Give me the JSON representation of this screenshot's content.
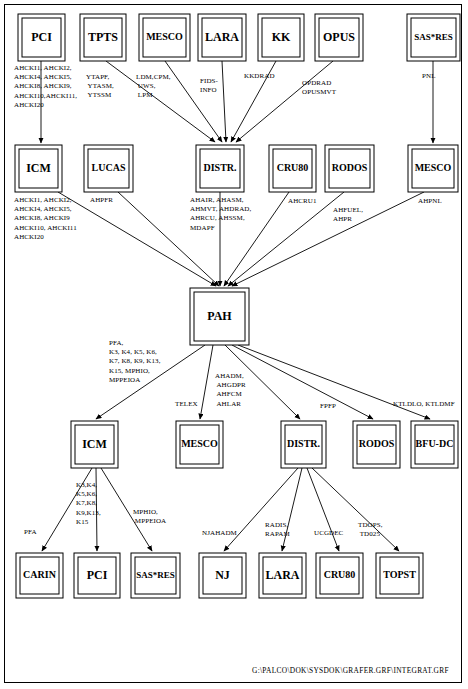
{
  "document": {
    "title": "PAH System Integration Diagram",
    "footer_path": "G:\\PALCO\\DOK\\SYSDOK\\GRAFER.GRF\\INTEGRAT.GRF"
  },
  "nodes": {
    "row1": [
      {
        "id": "pci-top",
        "label": "PCI",
        "x": 18,
        "y": 14,
        "w": 47,
        "h": 47
      },
      {
        "id": "tpts",
        "label": "TPTS",
        "x": 80,
        "y": 14,
        "w": 46,
        "h": 47
      },
      {
        "id": "mesco-top",
        "label": "MESCO",
        "x": 139,
        "y": 14,
        "w": 51,
        "h": 47
      },
      {
        "id": "lara-top",
        "label": "LARA",
        "x": 198,
        "y": 14,
        "w": 48,
        "h": 47
      },
      {
        "id": "kk",
        "label": "KK",
        "x": 258,
        "y": 14,
        "w": 46,
        "h": 47
      },
      {
        "id": "opus",
        "label": "OPUS",
        "x": 315,
        "y": 14,
        "w": 48,
        "h": 47
      },
      {
        "id": "sasres-top",
        "label": "SAS*RES",
        "x": 407,
        "y": 14,
        "w": 53,
        "h": 47
      }
    ],
    "row2": [
      {
        "id": "icm-r2",
        "label": "ICM",
        "x": 15,
        "y": 145,
        "w": 47,
        "h": 47
      },
      {
        "id": "lucas",
        "label": "LUCAS",
        "x": 84,
        "y": 145,
        "w": 49,
        "h": 47
      },
      {
        "id": "distr-r2",
        "label": "DISTR.",
        "x": 196,
        "y": 145,
        "w": 48,
        "h": 47
      },
      {
        "id": "cru80-r2",
        "label": "CRU80",
        "x": 269,
        "y": 145,
        "w": 47,
        "h": 47
      },
      {
        "id": "rodos-r2",
        "label": "RODOS",
        "x": 325,
        "y": 145,
        "w": 49,
        "h": 47
      },
      {
        "id": "mesco-r2",
        "label": "MESCO",
        "x": 408,
        "y": 145,
        "w": 50,
        "h": 47
      }
    ],
    "center": {
      "id": "pah",
      "label": "PAH",
      "x": 190,
      "y": 288,
      "w": 59,
      "h": 57
    },
    "row4": [
      {
        "id": "icm-r4",
        "label": "ICM",
        "x": 71,
        "y": 421,
        "w": 47,
        "h": 47
      },
      {
        "id": "mesco-r4",
        "label": "MESCO",
        "x": 176,
        "y": 421,
        "w": 47,
        "h": 47
      },
      {
        "id": "distr-r4",
        "label": "DISTR.",
        "x": 281,
        "y": 421,
        "w": 45,
        "h": 47
      },
      {
        "id": "rodos-r4",
        "label": "RODOS",
        "x": 353,
        "y": 421,
        "w": 47,
        "h": 47
      },
      {
        "id": "bfudc",
        "label": "BFU-DC",
        "x": 411,
        "y": 421,
        "w": 47,
        "h": 47
      }
    ],
    "row5": [
      {
        "id": "carin",
        "label": "CARIN",
        "x": 16,
        "y": 553,
        "w": 47,
        "h": 45
      },
      {
        "id": "pci-bot",
        "label": "PCI",
        "x": 74,
        "y": 553,
        "w": 46,
        "h": 45
      },
      {
        "id": "sasres-bot",
        "label": "SAS*RES",
        "x": 131,
        "y": 553,
        "w": 49,
        "h": 45
      },
      {
        "id": "nj",
        "label": "NJ",
        "x": 199,
        "y": 553,
        "w": 47,
        "h": 45
      },
      {
        "id": "lara-bot",
        "label": "LARA",
        "x": 259,
        "y": 553,
        "w": 47,
        "h": 45
      },
      {
        "id": "cru80-bot",
        "label": "CRU80",
        "x": 316,
        "y": 553,
        "w": 47,
        "h": 45
      },
      {
        "id": "topst",
        "label": "TOPST",
        "x": 376,
        "y": 553,
        "w": 47,
        "h": 45
      }
    ]
  },
  "edges": [
    {
      "id": "e-pci-icm",
      "from": "pci-top",
      "to": "icm-r2",
      "x1": 41,
      "y1": 61,
      "x2": 41,
      "y2": 143
    },
    {
      "id": "e-sasres-mesco",
      "from": "sasres-top",
      "to": "mesco-r2",
      "x1": 433,
      "y1": 61,
      "x2": 433,
      "y2": 143
    },
    {
      "id": "e-tpts-distr",
      "from": "tpts",
      "to": "distr-r2",
      "x1": 106,
      "y1": 61,
      "x2": 215,
      "y2": 142
    },
    {
      "id": "e-mesco-distr",
      "from": "mesco-top",
      "to": "distr-r2",
      "x1": 165,
      "y1": 61,
      "x2": 222,
      "y2": 142
    },
    {
      "id": "e-lara-distr",
      "from": "lara-top",
      "to": "distr-r2",
      "x1": 222,
      "y1": 61,
      "x2": 226,
      "y2": 142
    },
    {
      "id": "e-kk-distr",
      "from": "kk",
      "to": "distr-r2",
      "x1": 276,
      "y1": 61,
      "x2": 231,
      "y2": 142
    },
    {
      "id": "e-opus-distr",
      "from": "opus",
      "to": "distr-r2",
      "x1": 333,
      "y1": 61,
      "x2": 236,
      "y2": 142
    },
    {
      "id": "e-icm-pah",
      "from": "icm-r2",
      "to": "pah",
      "x1": 58,
      "y1": 192,
      "x2": 216,
      "y2": 286
    },
    {
      "id": "e-lucas-pah",
      "from": "lucas",
      "to": "pah",
      "x1": 118,
      "y1": 192,
      "x2": 219,
      "y2": 286
    },
    {
      "id": "e-distr-pah",
      "from": "distr-r2",
      "to": "pah",
      "x1": 220,
      "y1": 192,
      "x2": 220,
      "y2": 286
    },
    {
      "id": "e-cru80-pah",
      "from": "cru80-r2",
      "to": "pah",
      "x1": 289,
      "y1": 192,
      "x2": 224,
      "y2": 286
    },
    {
      "id": "e-rodos-pah",
      "from": "rodos-r2",
      "to": "pah",
      "x1": 344,
      "y1": 192,
      "x2": 228,
      "y2": 286
    },
    {
      "id": "e-mesco-pah",
      "from": "mesco-r2",
      "to": "pah",
      "x1": 424,
      "y1": 192,
      "x2": 232,
      "y2": 286
    },
    {
      "id": "e-pah-icm",
      "from": "pah",
      "to": "icm-r4",
      "x1": 205,
      "y1": 345,
      "x2": 96,
      "y2": 419
    },
    {
      "id": "e-pah-mesco",
      "from": "pah",
      "to": "mesco-r4",
      "x1": 213,
      "y1": 345,
      "x2": 200,
      "y2": 419
    },
    {
      "id": "e-pah-distr",
      "from": "pah",
      "to": "distr-r4",
      "x1": 225,
      "y1": 345,
      "x2": 300,
      "y2": 419
    },
    {
      "id": "e-pah-rodos",
      "from": "pah",
      "to": "rodos-r4",
      "x1": 232,
      "y1": 345,
      "x2": 373,
      "y2": 419
    },
    {
      "id": "e-pah-bfudc",
      "from": "pah",
      "to": "bfudc",
      "x1": 238,
      "y1": 345,
      "x2": 430,
      "y2": 419
    },
    {
      "id": "e-icm-carin",
      "from": "icm-r4",
      "to": "carin",
      "x1": 92,
      "y1": 468,
      "x2": 42,
      "y2": 551
    },
    {
      "id": "e-icm-pci",
      "from": "icm-r4",
      "to": "pci-bot",
      "x1": 96,
      "y1": 468,
      "x2": 97,
      "y2": 551
    },
    {
      "id": "e-icm-sasres",
      "from": "icm-r4",
      "to": "sasres-bot",
      "x1": 101,
      "y1": 468,
      "x2": 152,
      "y2": 551
    },
    {
      "id": "e-distr-nj",
      "from": "distr-r4",
      "to": "nj",
      "x1": 298,
      "y1": 468,
      "x2": 224,
      "y2": 551
    },
    {
      "id": "e-distr-lara",
      "from": "distr-r4",
      "to": "lara-bot",
      "x1": 302,
      "y1": 468,
      "x2": 282,
      "y2": 551
    },
    {
      "id": "e-distr-cru80",
      "from": "distr-r4",
      "to": "cru80-bot",
      "x1": 307,
      "y1": 468,
      "x2": 339,
      "y2": 551
    },
    {
      "id": "e-distr-topst",
      "from": "distr-r4",
      "to": "topst",
      "x1": 312,
      "y1": 468,
      "x2": 399,
      "y2": 551
    }
  ],
  "edge_labels": [
    {
      "id": "lbl-pci-top",
      "x": 14,
      "y": 70,
      "lines": [
        "AHCKI1, AHCKI2,",
        "AHCKI4, AHCKI5,",
        "AHCKI8, AHCKI9,",
        "AHCKI10,AHCKI11,",
        "AHCKI20"
      ]
    },
    {
      "id": "lbl-tpts",
      "x": 86,
      "y": 79,
      "lines": [
        "YTAPF,",
        "  YTASM,",
        "    YTSSM"
      ]
    },
    {
      "id": "lbl-mesco-top",
      "x": 136,
      "y": 79,
      "lines": [
        "LDM,CPM,",
        "  UWS,",
        "   LPM"
      ]
    },
    {
      "id": "lbl-lara-top",
      "x": 200,
      "y": 83,
      "lines": [
        "FIDS-",
        "INFO"
      ]
    },
    {
      "id": "lbl-kk",
      "x": 244,
      "y": 78,
      "lines": [
        "KKDRAD"
      ]
    },
    {
      "id": "lbl-opus",
      "x": 302,
      "y": 85,
      "lines": [
        "OPDRAD",
        "OPUSMVT"
      ]
    },
    {
      "id": "lbl-sasres-top",
      "x": 422,
      "y": 78,
      "lines": [
        "PNL"
      ]
    },
    {
      "id": "lbl-icm-r2",
      "x": 14,
      "y": 202,
      "lines": [
        "AHCKI1,  AHCKI2,",
        "AHCKI4,  AHCKI5,",
        "AHCKI8,  AHCKI9",
        "AHCKI10, AHCKI11",
        "AHCKI20"
      ]
    },
    {
      "id": "lbl-lucas",
      "x": 90,
      "y": 202,
      "lines": [
        "AHPFR"
      ]
    },
    {
      "id": "lbl-distr-r2",
      "x": 190,
      "y": 202,
      "lines": [
        "AHAIR,  AHASM,",
        "AHMVT, AHDRAD,",
        "AHRCU,  AHSSM,",
        "MDAPF"
      ]
    },
    {
      "id": "lbl-cru80-r2",
      "x": 288,
      "y": 203,
      "lines": [
        "AHCRU1"
      ]
    },
    {
      "id": "lbl-rodos-r2",
      "x": 333,
      "y": 212,
      "lines": [
        "AHFUEL,",
        "AHPR"
      ]
    },
    {
      "id": "lbl-mesco-r2",
      "x": 418,
      "y": 203,
      "lines": [
        "AHPNL"
      ]
    },
    {
      "id": "lbl-pah-icm",
      "x": 109,
      "y": 345,
      "lines": [
        "PFA,",
        "K3, K4, K5, K6,",
        "K7, K8, K9, K13,",
        "K15, MPHIO,",
        "MPPEIOA"
      ]
    },
    {
      "id": "lbl-pah-mesco",
      "x": 175,
      "y": 406,
      "lines": [
        "TELEX"
      ]
    },
    {
      "id": "lbl-pah-distr",
      "x": 215,
      "y": 378,
      "lines": [
        "AHADM,",
        "   AHGDPR",
        "      AHFCM",
        "        AHLAR"
      ]
    },
    {
      "id": "lbl-pah-rodos",
      "x": 320,
      "y": 408,
      "lines": [
        "FPFP"
      ]
    },
    {
      "id": "lbl-pah-bfudc",
      "x": 393,
      "y": 406,
      "lines": [
        "KTLDLO, KTLDMF"
      ]
    },
    {
      "id": "lbl-icm-carin",
      "x": 24,
      "y": 534,
      "lines": [
        "PFA"
      ]
    },
    {
      "id": "lbl-icm-pci",
      "x": 76,
      "y": 487,
      "lines": [
        "K3,K4,",
        "K5,K6,",
        "K7,K8,",
        "K9,K13,",
        "K15"
      ]
    },
    {
      "id": "lbl-icm-sasres",
      "x": 133,
      "y": 514,
      "lines": [
        "MPHIO,",
        "  MPPEIOA"
      ]
    },
    {
      "id": "lbl-distr-nj",
      "x": 202,
      "y": 535,
      "lines": [
        "NJAHADM"
      ]
    },
    {
      "id": "lbl-distr-lara",
      "x": 265,
      "y": 527,
      "lines": [
        "RADIS,",
        "RAPAM"
      ]
    },
    {
      "id": "lbl-distr-cru80",
      "x": 314,
      "y": 535,
      "lines": [
        "UCGDEC"
      ]
    },
    {
      "id": "lbl-distr-topst",
      "x": 358,
      "y": 527,
      "lines": [
        "TDOPS,",
        "  TD025"
      ]
    }
  ]
}
